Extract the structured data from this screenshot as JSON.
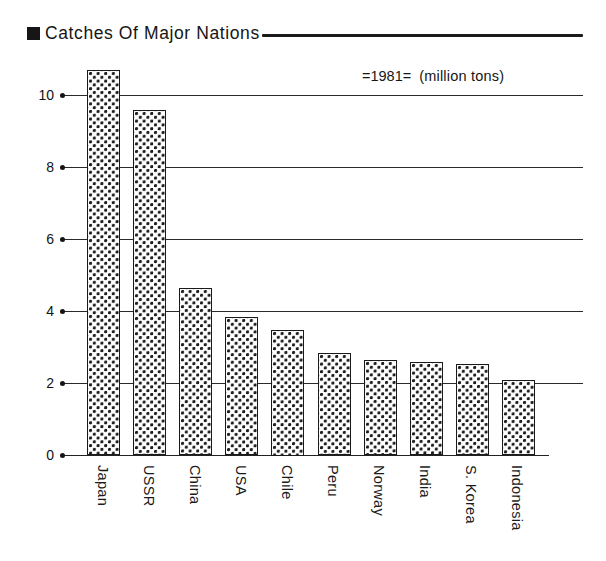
{
  "title": {
    "text": "Catches Of Major Nations",
    "bullet_icon": "filled-square-icon"
  },
  "legend": {
    "year": "=1981=",
    "unit": "(million tons)"
  },
  "chart_data": {
    "type": "bar",
    "title": "Catches Of Major Nations",
    "subtitle": "=1981=  (million tons)",
    "xlabel": "",
    "ylabel": "",
    "unit": "million tons",
    "year": "1981",
    "ylim": [
      0,
      11
    ],
    "yticks": [
      0,
      2,
      4,
      6,
      8,
      10
    ],
    "ytick_labels": [
      "0",
      "2",
      "4",
      "6",
      "8",
      "10"
    ],
    "grid": true,
    "grid_axis": "y",
    "legend_position": "top-right",
    "categories": [
      "Japan",
      "USSR",
      "China",
      "USA",
      "Chile",
      "Peru",
      "Norway",
      "India",
      "S. Korea",
      "Indonesia"
    ],
    "values": [
      10.7,
      9.6,
      4.65,
      3.85,
      3.5,
      2.85,
      2.65,
      2.6,
      2.55,
      2.1
    ],
    "bar_fill": "dotted-stipple",
    "bar_edge_color": "#1a1a1a",
    "background_color": "#ffffff"
  },
  "colors": {
    "ink": "#1a1a1a",
    "grid": "#2a2a2a",
    "paper": "#ffffff"
  }
}
